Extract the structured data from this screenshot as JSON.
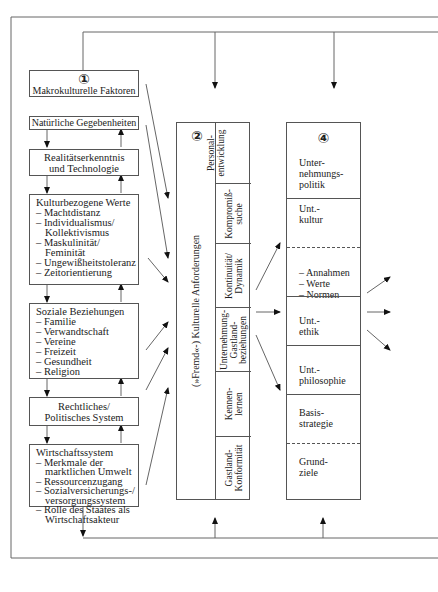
{
  "box1": {
    "number": "①",
    "title": "Makrokulturelle Faktoren"
  },
  "factors": [
    {
      "title": "Natürliche Gegebenheiten",
      "items": []
    },
    {
      "title": "Realitätserkenntnis und Technologie",
      "items": []
    },
    {
      "title": "Kulturbezogene Werte",
      "items": [
        "– Machtdistanz",
        "– Individualismus/ Kollektivismus",
        "– Maskulinität/ Feminität",
        "– Ungewißheitstoleranz",
        "– Zeitorientierung"
      ]
    },
    {
      "title": "Soziale Beziehungen",
      "items": [
        "– Familie",
        "– Verwandtschaft",
        "– Vereine",
        "– Freizeit",
        "– Gesundheit",
        "– Religion"
      ]
    },
    {
      "title": "Rechtliches/ Politisches System",
      "items": []
    },
    {
      "title": "Wirtschaftssystem",
      "items": [
        "– Merkmale der marktlichen Umwelt",
        "– Ressourcenzugang",
        "– Sozialversicherungs-/ versorgungssystem",
        "– Rolle des Staates als Wirtschaftsakteur"
      ]
    }
  ],
  "box2": {
    "number": "②",
    "main_label": "(»Fremd«-) Kulturelle Anforderungen",
    "segments": [
      "Personal- entwicklung",
      "Kompromiß- suche",
      "Kontinuität/ Dynamik",
      "Unternehmung- Gastland- beziehungen",
      "Kennen- lernen",
      "Gastland- Konformität"
    ]
  },
  "box4": {
    "number": "④",
    "cells": [
      {
        "label": "Unter- nehmungs- politik",
        "border": "none"
      },
      {
        "label": "Unt.- kultur",
        "border": "solid"
      },
      {
        "label": "– Annahmen\n– Werte\n– Normen",
        "border": "dashed"
      },
      {
        "label": "Unt.- ethik",
        "border": "solid"
      },
      {
        "label": "Unt.- philosophie",
        "border": "solid"
      },
      {
        "label": "Basis- strategie",
        "border": "solid"
      },
      {
        "label": "Grund- ziele",
        "border": "dashed"
      }
    ]
  }
}
